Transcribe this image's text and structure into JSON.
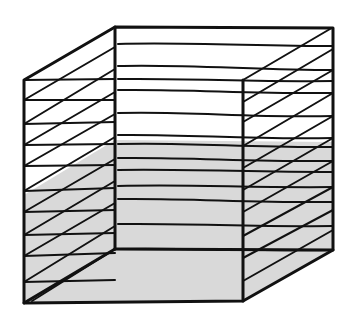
{
  "figure": {
    "colors": {
      "background": "#ffffff",
      "line": "#111111",
      "shade": "#d9d9d9"
    },
    "layer_count": 12,
    "shaded_layers_from_bottom": 6
  }
}
